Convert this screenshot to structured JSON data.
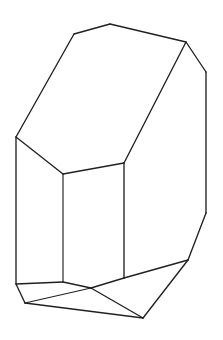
{
  "figure": {
    "style": "black outline on white background",
    "background_color": "#ffffff",
    "stroke_color": "#231f20",
    "stroke_width": 1.35,
    "canvas": {
      "width": 223,
      "height": 340
    }
  },
  "geometry": {
    "vertices": {
      "top_apex": [
        110,
        24
      ],
      "top_left_shoulder": [
        74,
        34
      ],
      "top_right_corner": [
        186,
        42
      ],
      "left_upper_corner": [
        16,
        137
      ],
      "right_upper_bend": [
        206,
        72
      ],
      "mid_left": [
        63,
        174
      ],
      "mid_right": [
        124,
        163
      ],
      "right_lower_bend": [
        206,
        213
      ],
      "left_lower_corner": [
        16,
        284
      ],
      "mid_left_lower": [
        63,
        282
      ],
      "mid_right_lower": [
        124,
        278
      ],
      "bottom_left_corner": [
        25,
        303
      ],
      "bottom_center_junction": [
        91,
        288
      ],
      "bottom_apex": [
        143,
        318
      ],
      "bottom_right_corner": [
        188,
        260
      ]
    },
    "faces": [
      {
        "name": "top-face",
        "points": "110,24 186,42 124,163 63,174 16,137 74,34"
      },
      {
        "name": "front-left-face",
        "points": "16,137 63,174 63,282 16,284"
      },
      {
        "name": "front-center-face",
        "points": "63,174 124,163 124,278 63,282"
      },
      {
        "name": "right-side-face",
        "points": "186,42 206,72 206,213 188,260 124,278 124,163"
      },
      {
        "name": "bottom-left-facet",
        "points": "16,284 63,282 91,288 25,303"
      },
      {
        "name": "bottom-center-facet",
        "points": "25,303 91,288 143,318"
      },
      {
        "name": "bottom-right-facet",
        "points": "91,288 124,278 188,260 143,318"
      }
    ],
    "edges": [
      {
        "name": "top-left-upper-edge",
        "path": "M 74,34 L 110,24"
      },
      {
        "name": "top-right-upper-edge",
        "path": "M 110,24 L 186,42"
      },
      {
        "name": "upper-left-slope-edge",
        "path": "M 74,34 L 16,137"
      },
      {
        "name": "top-face-left-edge",
        "path": "M 16,137 L 63,174"
      },
      {
        "name": "top-face-front-edge",
        "path": "M 63,174 L 124,163"
      },
      {
        "name": "top-face-right-edge",
        "path": "M 124,163 L 186,42"
      },
      {
        "name": "right-bevel-upper-edge",
        "path": "M 186,42 L 206,72"
      },
      {
        "name": "right-vertical-edge",
        "path": "M 206,72 L 206,213"
      },
      {
        "name": "right-bevel-lower-edge",
        "path": "M 206,213 L 188,260"
      },
      {
        "name": "left-vertical-edge",
        "path": "M 16,137 L 16,284"
      },
      {
        "name": "center-left-vertical-edge",
        "path": "M 63,174 L 63,282"
      },
      {
        "name": "center-right-vertical-edge",
        "path": "M 124,163 L 124,278"
      },
      {
        "name": "bottom-left-front-edge",
        "path": "M 16,284 L 63,282"
      },
      {
        "name": "bottom-center-front-edge",
        "path": "M 63,282 L 91,288"
      },
      {
        "name": "bottom-right-front-edge",
        "path": "M 91,288 L 124,278"
      },
      {
        "name": "bottom-left-bevel-edge",
        "path": "M 16,284 L 25,303"
      },
      {
        "name": "bottom-left-base-edge",
        "path": "M 25,303 L 91,288"
      },
      {
        "name": "bottom-base-left-edge",
        "path": "M 25,303 L 143,318"
      },
      {
        "name": "bottom-center-bevel-edge",
        "path": "M 91,288 L 143,318"
      },
      {
        "name": "bottom-right-base-edge",
        "path": "M 143,318 L 188,260"
      },
      {
        "name": "bottom-right-corner-edge",
        "path": "M 188,260 L 124,278"
      }
    ]
  }
}
